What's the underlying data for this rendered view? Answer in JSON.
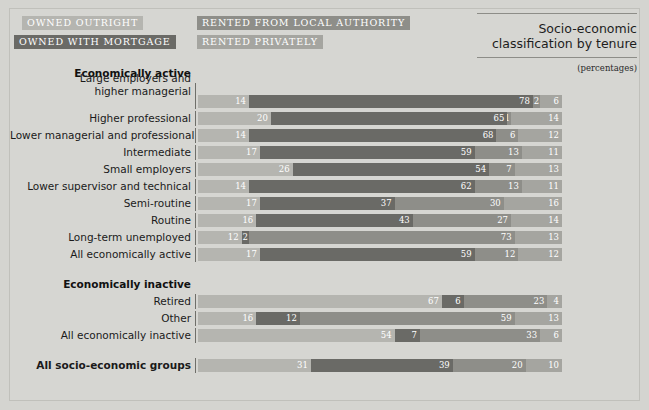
{
  "header": {
    "title_line1": "Socio-economic",
    "title_line2": "classification by tenure",
    "units": "(percentages)"
  },
  "legend": [
    {
      "id": "owned-outright",
      "label": "OWNED OUTRIGHT",
      "color": "#b5b5b0"
    },
    {
      "id": "owned-with-mortgage",
      "label": "OWNED WITH MORTGAGE",
      "color": "#6a6a66"
    },
    {
      "id": "rented-from-local-authority",
      "label": "RENTED FROM LOCAL AUTHORITY",
      "color": "#8e8e89"
    },
    {
      "id": "rented-privately",
      "label": "RENTED PRIVATELY",
      "color": "#a5a5a0"
    }
  ],
  "groups": [
    {
      "title": "Economically active",
      "rows": [
        {
          "label": "Large employers and\nhigher managerial",
          "label_lines": [
            "Large employers and",
            "higher managerial"
          ],
          "values": [
            14,
            78,
            2,
            6
          ]
        },
        {
          "label": "Higher professional",
          "values": [
            20,
            65,
            1,
            14
          ]
        },
        {
          "label": "Lower managerial and professional",
          "values": [
            14,
            68,
            6,
            12
          ]
        },
        {
          "label": "Intermediate",
          "values": [
            17,
            59,
            13,
            11
          ]
        },
        {
          "label": "Small employers",
          "values": [
            26,
            54,
            7,
            13
          ]
        },
        {
          "label": "Lower supervisor and technical",
          "values": [
            14,
            62,
            13,
            11
          ]
        },
        {
          "label": "Semi-routine",
          "values": [
            17,
            37,
            30,
            16
          ]
        },
        {
          "label": "Routine",
          "values": [
            16,
            43,
            27,
            14
          ]
        },
        {
          "label": "Long-term unemployed",
          "values": [
            12,
            2,
            73,
            13
          ]
        },
        {
          "label": "All economically active",
          "values": [
            17,
            59,
            12,
            12
          ]
        }
      ]
    },
    {
      "title": "Economically inactive",
      "rows": [
        {
          "label": "Retired",
          "values": [
            67,
            6,
            23,
            4
          ]
        },
        {
          "label": "Other",
          "values": [
            16,
            12,
            59,
            13
          ]
        },
        {
          "label": "All economically inactive",
          "values": [
            54,
            7,
            33,
            6
          ]
        }
      ]
    },
    {
      "title": "",
      "rows": [
        {
          "label": "All socio-economic groups",
          "bold": true,
          "values": [
            31,
            39,
            20,
            10
          ]
        }
      ]
    }
  ],
  "chart_data": {
    "type": "bar",
    "orientation": "horizontal",
    "stacked": true,
    "normalized": true,
    "title": "Socio-economic classification by tenure",
    "subtitle": "(percentages)",
    "xlabel": "",
    "ylabel": "",
    "xlim": [
      0,
      100
    ],
    "grid": false,
    "legend_position": "top-left",
    "categories": [
      "Large employers and higher managerial",
      "Higher professional",
      "Lower managerial and professional",
      "Intermediate",
      "Small employers",
      "Lower supervisor and technical",
      "Semi-routine",
      "Routine",
      "Long-term unemployed",
      "All economically active",
      "Retired",
      "Other",
      "All economically inactive",
      "All socio-economic groups"
    ],
    "series": [
      {
        "name": "OWNED OUTRIGHT",
        "color": "#b5b5b0",
        "values": [
          14,
          20,
          14,
          17,
          26,
          14,
          17,
          16,
          12,
          17,
          67,
          16,
          54,
          31
        ]
      },
      {
        "name": "OWNED WITH MORTGAGE",
        "color": "#6a6a66",
        "values": [
          78,
          65,
          68,
          59,
          54,
          62,
          37,
          43,
          2,
          59,
          6,
          12,
          7,
          39
        ]
      },
      {
        "name": "RENTED FROM LOCAL AUTHORITY",
        "color": "#8e8e89",
        "values": [
          2,
          1,
          6,
          13,
          7,
          13,
          30,
          27,
          73,
          12,
          23,
          59,
          33,
          20
        ]
      },
      {
        "name": "RENTED PRIVATELY",
        "color": "#a5a5a0",
        "values": [
          6,
          14,
          12,
          11,
          13,
          11,
          16,
          14,
          13,
          12,
          4,
          13,
          6,
          10
        ]
      }
    ]
  }
}
